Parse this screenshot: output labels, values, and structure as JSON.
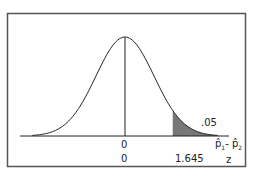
{
  "chart_data": {
    "type": "area",
    "title": "",
    "distribution": "normal",
    "mean": 0,
    "shaded_region": {
      "from_z": 1.645,
      "to_z": "inf",
      "area": 0.05
    },
    "x_axis_rows": [
      {
        "variable": "p̂₁ - p̂₂",
        "center_label": "0",
        "critical_label": ""
      },
      {
        "variable": "z",
        "center_label": "0",
        "critical_label": "1.645"
      }
    ],
    "annotations": [
      ".05"
    ],
    "grid": false,
    "legend": null
  },
  "labels": {
    "area": ".05",
    "center_top": "0",
    "center_bottom": "0",
    "critical": "1.645",
    "axis_top_var_p1": "p̂",
    "axis_top_sub1": "1",
    "axis_top_dash": "- ",
    "axis_top_var_p2": "p̂",
    "axis_top_sub2": "2",
    "axis_bottom_var": "z"
  }
}
